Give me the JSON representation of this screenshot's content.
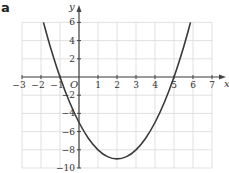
{
  "panel_label": "a",
  "colors": {
    "grid": "#d9d9d9",
    "axis": "#444444",
    "curve": "#3a3a3a",
    "text": "#333333"
  },
  "chart_data": {
    "type": "line",
    "title": "",
    "xlabel": "x",
    "ylabel": "y",
    "xlim": [
      -3,
      7
    ],
    "ylim": [
      -10,
      6
    ],
    "grid": true,
    "x_ticks": [
      -3,
      -2,
      -1,
      1,
      2,
      3,
      4,
      5,
      6,
      7
    ],
    "y_ticks": [
      6,
      4,
      2,
      -2,
      -4,
      -6,
      -8,
      -10
    ],
    "origin_label": "O",
    "series": [
      {
        "name": "y = x^2 - 4x - 5",
        "function": "y = (x + 1)(x - 5)",
        "x": [
          -1.87,
          -1.5,
          -1,
          -0.5,
          0,
          0.5,
          1,
          1.5,
          2,
          2.5,
          3,
          3.5,
          4,
          4.5,
          5,
          5.5,
          5.87
        ],
        "y": [
          6,
          3.25,
          0,
          -2.75,
          -5,
          -6.75,
          -8,
          -8.75,
          -9,
          -8.75,
          -8,
          -6.75,
          -5,
          -2.75,
          0,
          3.25,
          6
        ]
      }
    ],
    "key_points": {
      "x_intercepts": [
        -1,
        5
      ],
      "y_intercept": -5,
      "vertex": [
        2,
        -9
      ]
    }
  }
}
